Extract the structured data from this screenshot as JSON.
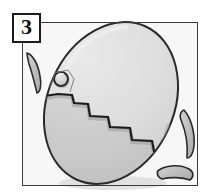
{
  "figure": {
    "panel_number": "3",
    "caption": ""
  },
  "frame": {
    "x": 22,
    "y": 22,
    "width": 176,
    "height": 164,
    "stroke": "#3a3a3a",
    "stroke_width": 1,
    "fill": "#f7f7f7"
  },
  "label": {
    "text": "3",
    "x": 12,
    "y": 13,
    "width": 29,
    "height": 30,
    "border_color": "#1a1a1a",
    "background": "#ffffff",
    "text_color": "#111111"
  },
  "colors": {
    "background": "#ffffff",
    "frame_fill": "#f7f7f7",
    "egg_upper_fill": "#d6d6d6",
    "egg_lower_fill": "#c9c9c9",
    "egg_outline": "#2a2a2a",
    "crack_line": "#1c1c1c",
    "shard_fill": "#c0c0c0",
    "shard_outline": "#2a2a2a",
    "hole_fill": "#d0d0d0",
    "hole_outline": "#2a2a2a",
    "shadow": "#b5b5b5",
    "highlight": "#e6e6e6"
  },
  "egg": {
    "center_x": 111,
    "center_y": 103,
    "radius_x": 63,
    "radius_y": 84,
    "rotation_deg": 24,
    "outline_width": 2
  },
  "hole": {
    "center_x": 61,
    "center_y": 79,
    "radius": 7,
    "outline_width": 2
  },
  "crack": {
    "description": "descending staircase zigzag from upper-left of egg to lower-right",
    "points": [
      [
        44,
        97
      ],
      [
        58,
        95
      ],
      [
        72,
        96
      ],
      [
        74,
        104
      ],
      [
        88,
        105
      ],
      [
        90,
        117
      ],
      [
        108,
        118
      ],
      [
        110,
        128
      ],
      [
        130,
        129
      ],
      [
        132,
        141
      ],
      [
        152,
        142
      ],
      [
        154,
        152
      ],
      [
        170,
        153
      ]
    ],
    "stroke_width": 2
  },
  "shards": [
    {
      "name": "shard-left",
      "points": [
        [
          26,
          54
        ],
        [
          36,
          59
        ],
        [
          41,
          76
        ],
        [
          38,
          92
        ],
        [
          31,
          80
        ],
        [
          27,
          66
        ]
      ],
      "rotation_deg": -10
    },
    {
      "name": "shard-right-upper",
      "points": [
        [
          183,
          112
        ],
        [
          192,
          122
        ],
        [
          194,
          140
        ],
        [
          187,
          156
        ],
        [
          180,
          144
        ],
        [
          178,
          126
        ]
      ],
      "rotation_deg": 8
    },
    {
      "name": "shard-right-lower",
      "points": [
        [
          162,
          168
        ],
        [
          178,
          165
        ],
        [
          190,
          172
        ],
        [
          186,
          180
        ],
        [
          170,
          181
        ],
        [
          160,
          176
        ]
      ],
      "rotation_deg": 0
    }
  ]
}
